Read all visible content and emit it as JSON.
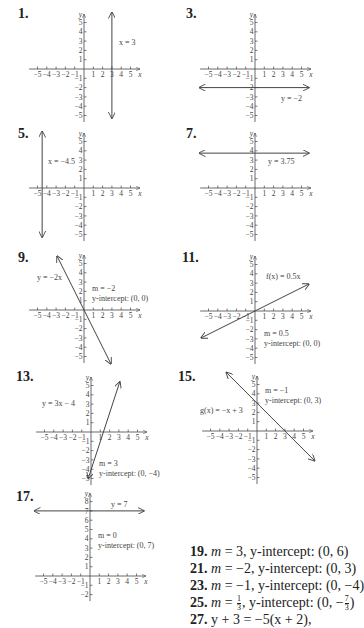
{
  "graphs": [
    {
      "num": "1.",
      "label": "x = 3",
      "ox": 84,
      "oy": 69,
      "numx": 18,
      "numy": 6,
      "ymin": -5,
      "ymax": 5,
      "line": {
        "type": "vertical",
        "x": 3
      },
      "labelPos": [
        119,
        45
      ],
      "notes": []
    },
    {
      "num": "3.",
      "label": "y = −2",
      "ox": 255,
      "oy": 69,
      "numx": 186,
      "numy": 6,
      "ymin": -5,
      "ymax": 5,
      "line": {
        "type": "horizontal",
        "y": -2
      },
      "labelPos": [
        281,
        101
      ],
      "notes": []
    },
    {
      "num": "5.",
      "label": "x = −4.5",
      "ox": 84,
      "oy": 188,
      "numx": 18,
      "numy": 126,
      "ymin": -5,
      "ymax": 5,
      "line": {
        "type": "vertical",
        "x": -4.5
      },
      "labelPos": [
        48,
        164
      ],
      "notes": []
    },
    {
      "num": "7.",
      "label": "y = 3.75",
      "ox": 255,
      "oy": 188,
      "numx": 186,
      "numy": 126,
      "ymin": -5,
      "ymax": 5,
      "line": {
        "type": "horizontal",
        "y": 3.75
      },
      "labelPos": [
        268,
        164
      ],
      "notes": []
    },
    {
      "num": "9.",
      "label": "y = −2x",
      "ox": 84,
      "oy": 310,
      "numx": 18,
      "numy": 250,
      "ymin": -5,
      "ymax": 5,
      "line": {
        "type": "segment",
        "x1": -2.9,
        "y1": 5.8,
        "x2": 2.9,
        "y2": -5.8
      },
      "labelPos": [
        37,
        280
      ],
      "notes": [
        "m = −2",
        "y-intercept: (0, 0)"
      ],
      "notesPos": [
        92,
        291
      ]
    },
    {
      "num": "11.",
      "label": "f(x) = 0.5x",
      "ox": 255,
      "oy": 311,
      "numx": 182,
      "numy": 250,
      "ymin": -5,
      "ymax": 5,
      "line": {
        "type": "segment",
        "x1": -5.8,
        "y1": -2.9,
        "x2": 5.8,
        "y2": 2.9
      },
      "labelPos": [
        266,
        279
      ],
      "notes": [
        "m = 0.5",
        "y-intercept: (0, 0)"
      ],
      "notesPos": [
        264,
        336
      ]
    },
    {
      "num": "13.",
      "label": "y = 3x − 4",
      "ox": 91,
      "oy": 432,
      "numx": 16,
      "numy": 369,
      "ymin": -5,
      "ymax": 5,
      "line": {
        "type": "segment",
        "x1": -0.3,
        "y1": -5,
        "x2": 3.1,
        "y2": 5.4
      },
      "labelPos": [
        42,
        406
      ],
      "notes": [
        "m = 3",
        "y-intercept: (0, −4)"
      ],
      "notesPos": [
        99,
        466
      ]
    },
    {
      "num": "15.",
      "label": "g(x) = −x + 3",
      "ox": 257,
      "oy": 431,
      "numx": 178,
      "numy": 369,
      "ymin": -5,
      "ymax": 5,
      "line": {
        "type": "segment",
        "x1": -3.3,
        "y1": 6.3,
        "x2": 6.2,
        "y2": -3.2
      },
      "labelPos": [
        200,
        413
      ],
      "notes": [
        "m = −1",
        "y-intercept: (0, 3)"
      ],
      "notesPos": [
        265,
        393
      ]
    },
    {
      "num": "17.",
      "label": "y = 7",
      "ox": 90,
      "oy": 576,
      "numx": 16,
      "numy": 489,
      "ymin": -2,
      "ymax": 8,
      "line": {
        "type": "horizontal",
        "y": 7
      },
      "labelPos": [
        111,
        507
      ],
      "notes": [
        "m = 0",
        "y-intercept: (0, 7)"
      ],
      "notesPos": [
        98,
        538
      ]
    }
  ],
  "answers": [
    {
      "num": "19.",
      "parts": [
        "m",
        " = 3, y-intercept: (0, 6)"
      ]
    },
    {
      "num": "21.",
      "parts": [
        "m",
        " = −2, y-intercept: (0, 3)"
      ]
    },
    {
      "num": "23.",
      "parts": [
        "m",
        " = −1, y-intercept: (0, −4)"
      ]
    },
    {
      "num": "25.",
      "parts": [
        "m",
        " = ",
        "1",
        "3",
        ", y-intercept: (0, −",
        "7",
        "3",
        ")"
      ]
    },
    {
      "num": "27.",
      "text": "y + 3 = −5(x + 2),"
    },
    {
      "num": "",
      "text": "or y = −5x − 13"
    },
    {
      "num": "29.",
      "text": "y − 3 = −2(x − 2), or"
    },
    {
      "num": "",
      "text": "y = −2x + 7"
    }
  ],
  "axis": {
    "xlabel": "x",
    "ylabel": "y",
    "unit": 9.3,
    "xmin": -5,
    "xmax": 5
  },
  "colors": {
    "ink": "#444444",
    "text": "#222222"
  }
}
